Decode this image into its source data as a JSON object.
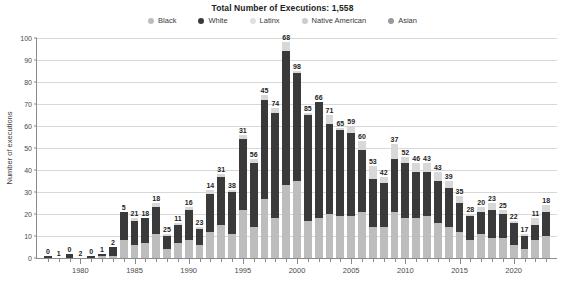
{
  "chart_data": {
    "type": "bar",
    "stacked": true,
    "title": "Total Number of Executions: 1,558",
    "xlabel": "",
    "ylabel": "Number of executions",
    "ylim": [
      0,
      100
    ],
    "ytick_values": [
      0,
      10,
      20,
      30,
      40,
      50,
      60,
      70,
      80,
      90,
      100
    ],
    "ytick_labels": [
      "0",
      "10",
      "20",
      "30",
      "40",
      "50",
      "60",
      "70",
      "80",
      "90",
      "100"
    ],
    "xtick_labels": [
      "1980",
      "1985",
      "1990",
      "1995",
      "2000",
      "2005",
      "2010",
      "2015",
      "2020"
    ],
    "xtick_values": [
      1980,
      1985,
      1990,
      1995,
      2000,
      2005,
      2010,
      2015,
      2020
    ],
    "grid": true,
    "legend_position": "top",
    "categories": [
      1977,
      1978,
      1979,
      1980,
      1981,
      1982,
      1983,
      1984,
      1985,
      1986,
      1987,
      1988,
      1989,
      1990,
      1991,
      1992,
      1993,
      1994,
      1995,
      1996,
      1997,
      1998,
      1999,
      2000,
      2001,
      2002,
      2003,
      2004,
      2005,
      2006,
      2007,
      2008,
      2009,
      2010,
      2011,
      2012,
      2013,
      2014,
      2015,
      2016,
      2017,
      2018,
      2019,
      2020,
      2021,
      2022,
      2023
    ],
    "totals": [
      1,
      0,
      2,
      0,
      1,
      2,
      5,
      21,
      18,
      18,
      25,
      11,
      16,
      23,
      14,
      31,
      38,
      31,
      56,
      45,
      74,
      68,
      98,
      85,
      66,
      71,
      65,
      59,
      60,
      53,
      42,
      37,
      52,
      46,
      43,
      43,
      39,
      35,
      28,
      20,
      23,
      25,
      22,
      17,
      11,
      18,
      24
    ],
    "series": [
      {
        "name": "Black",
        "color": "#bdbdbd",
        "values": [
          0,
          0,
          0,
          0,
          0,
          1,
          1,
          8,
          6,
          7,
          11,
          4,
          7,
          8,
          6,
          12,
          15,
          11,
          22,
          14,
          27,
          18,
          33,
          35,
          17,
          18,
          20,
          19,
          19,
          21,
          14,
          14,
          21,
          18,
          18,
          19,
          16,
          14,
          12,
          8,
          11,
          9,
          9,
          6,
          4,
          8,
          10
        ]
      },
      {
        "name": "White",
        "color": "#3a3a3a",
        "values": [
          1,
          0,
          2,
          0,
          1,
          1,
          4,
          13,
          11,
          11,
          12,
          6,
          8,
          14,
          7,
          17,
          22,
          19,
          32,
          29,
          45,
          48,
          61,
          49,
          48,
          53,
          41,
          39,
          38,
          28,
          22,
          20,
          24,
          25,
          21,
          20,
          19,
          18,
          13,
          11,
          10,
          13,
          11,
          10,
          6,
          7,
          11
        ]
      },
      {
        "name": "Latinx",
        "color": "#d8d8d8",
        "values": [
          0,
          0,
          0,
          0,
          0,
          0,
          0,
          0,
          1,
          0,
          2,
          1,
          1,
          1,
          1,
          2,
          1,
          1,
          2,
          2,
          2,
          2,
          4,
          1,
          1,
          0,
          4,
          1,
          3,
          4,
          6,
          3,
          7,
          3,
          4,
          4,
          4,
          3,
          3,
          1,
          2,
          3,
          2,
          1,
          1,
          3,
          3
        ]
      },
      {
        "name": "Native American",
        "color": "#cccccc",
        "values": [
          0,
          0,
          0,
          0,
          0,
          0,
          0,
          0,
          0,
          0,
          0,
          0,
          0,
          0,
          0,
          0,
          0,
          0,
          0,
          0,
          0,
          0,
          0,
          0,
          0,
          0,
          0,
          0,
          0,
          0,
          0,
          0,
          0,
          0,
          0,
          0,
          0,
          0,
          0,
          0,
          0,
          0,
          0,
          0,
          0,
          0,
          0
        ]
      },
      {
        "name": "Asian",
        "color": "#9a9a9a",
        "values": [
          0,
          0,
          0,
          0,
          0,
          0,
          0,
          0,
          0,
          0,
          0,
          0,
          0,
          0,
          0,
          0,
          0,
          0,
          0,
          0,
          0,
          0,
          0,
          0,
          0,
          0,
          0,
          0,
          0,
          0,
          0,
          0,
          0,
          0,
          0,
          0,
          0,
          0,
          0,
          0,
          0,
          0,
          0,
          0,
          0,
          0,
          0
        ]
      }
    ],
    "value_labels": [
      "0",
      "1",
      "0",
      "2",
      "0",
      "1",
      "2",
      "5",
      "21",
      "18",
      "18",
      "25",
      "11",
      "16",
      "23",
      "14",
      "31",
      "38",
      "31",
      "56",
      "45",
      "74",
      "68",
      "98",
      "85",
      "66",
      "71",
      "65",
      "59",
      "60",
      "53",
      "42",
      "37",
      "52",
      "46",
      "43",
      "43",
      "39",
      "35",
      "28",
      "20",
      "23",
      "25",
      "22",
      "17",
      "11",
      "18"
    ],
    "value_label_years": [
      1976,
      1977,
      1978,
      1979,
      1980,
      1981,
      1982,
      1983,
      1984,
      1985,
      1986,
      1987,
      1988,
      1989,
      1990,
      1991,
      1992,
      1993,
      1994,
      1995,
      1996,
      1997,
      1998,
      1999,
      2000,
      2001,
      2002,
      2003,
      2004,
      2005,
      2006,
      2007,
      2008,
      2009,
      2010,
      2011,
      2012,
      2013,
      2014,
      2015,
      2016,
      2017,
      2018,
      2019,
      2020,
      2021,
      2022
    ]
  },
  "legend": {
    "items": [
      {
        "label": "Black",
        "color": "#bdbdbd"
      },
      {
        "label": "White",
        "color": "#3a3a3a"
      },
      {
        "label": "Latinx",
        "color": "#e0e0e0"
      },
      {
        "label": "Native American",
        "color": "#cccccc"
      },
      {
        "label": "Asian",
        "color": "#9a9a9a"
      }
    ]
  }
}
